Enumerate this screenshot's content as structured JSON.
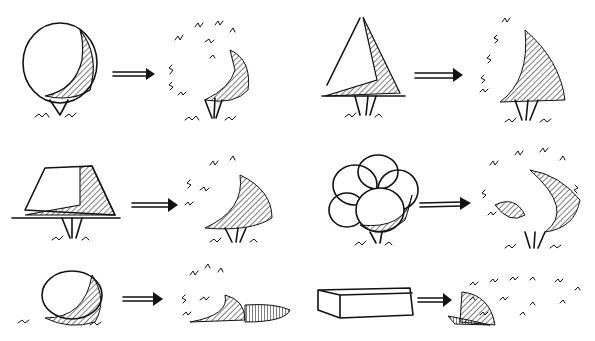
{
  "figure": {
    "ink_color": "#111111",
    "background": "#ffffff",
    "rows": [
      {
        "pairs": [
          {
            "form": "sphere",
            "result": "round-shrub"
          },
          {
            "form": "pyramid",
            "result": "conical-shrub"
          }
        ]
      },
      {
        "pairs": [
          {
            "form": "truncated-cone",
            "result": "spreading-shrub"
          },
          {
            "form": "clustered-spheres",
            "result": "multi-mass-tree"
          }
        ]
      },
      {
        "pairs": [
          {
            "form": "low-dome",
            "result": "mounded-groundcover"
          },
          {
            "form": "rectangular-box",
            "result": "clipped-hedge"
          }
        ]
      }
    ]
  }
}
